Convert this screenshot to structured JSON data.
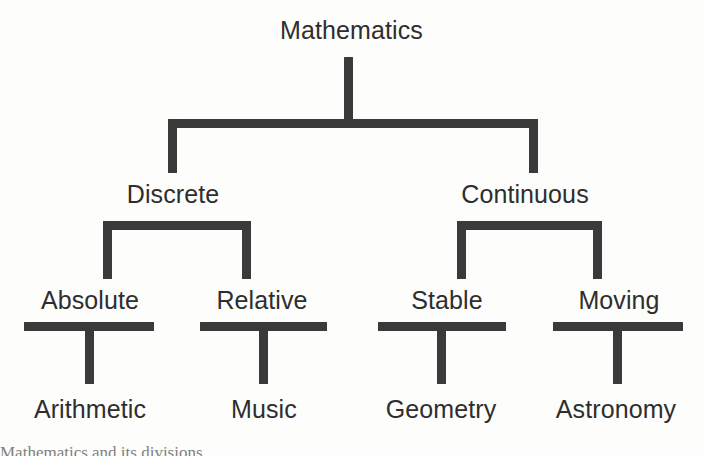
{
  "diagram": {
    "type": "tree",
    "title": "Mathematics",
    "orientation": "top-down",
    "depth": 4,
    "ink_color": "#3a3a3a",
    "text_color": "#2e2e2e",
    "background_color": "#fdfdfc",
    "root": {
      "label": "Mathematics",
      "children": [
        {
          "label": "Discrete",
          "children": [
            {
              "label": "Absolute",
              "children": [
                {
                  "label": "Arithmetic"
                }
              ]
            },
            {
              "label": "Relative",
              "children": [
                {
                  "label": "Music"
                }
              ]
            }
          ]
        },
        {
          "label": "Continuous",
          "children": [
            {
              "label": "Stable",
              "children": [
                {
                  "label": "Geometry"
                }
              ]
            },
            {
              "label": "Moving",
              "children": [
                {
                  "label": "Astronomy"
                }
              ]
            }
          ]
        }
      ]
    },
    "levels": [
      {
        "name": "root",
        "labels": [
          "Mathematics"
        ]
      },
      {
        "name": "branch",
        "labels": [
          "Discrete",
          "Continuous"
        ]
      },
      {
        "name": "sub",
        "labels": [
          "Absolute",
          "Relative",
          "Stable",
          "Moving"
        ]
      },
      {
        "name": "leaf",
        "labels": [
          "Arithmetic",
          "Music",
          "Geometry",
          "Astronomy"
        ]
      }
    ],
    "nodes": {
      "root": {
        "label": "Mathematics"
      },
      "branch_left": {
        "label": "Discrete"
      },
      "branch_right": {
        "label": "Continuous"
      },
      "sub_1": {
        "label": "Absolute"
      },
      "sub_2": {
        "label": "Relative"
      },
      "sub_3": {
        "label": "Stable"
      },
      "sub_4": {
        "label": "Moving"
      },
      "leaf_1": {
        "label": "Arithmetic"
      },
      "leaf_2": {
        "label": "Music"
      },
      "leaf_3": {
        "label": "Geometry"
      },
      "leaf_4": {
        "label": "Astronomy"
      }
    },
    "caption_fragment": "Mathematics and its divisions"
  }
}
